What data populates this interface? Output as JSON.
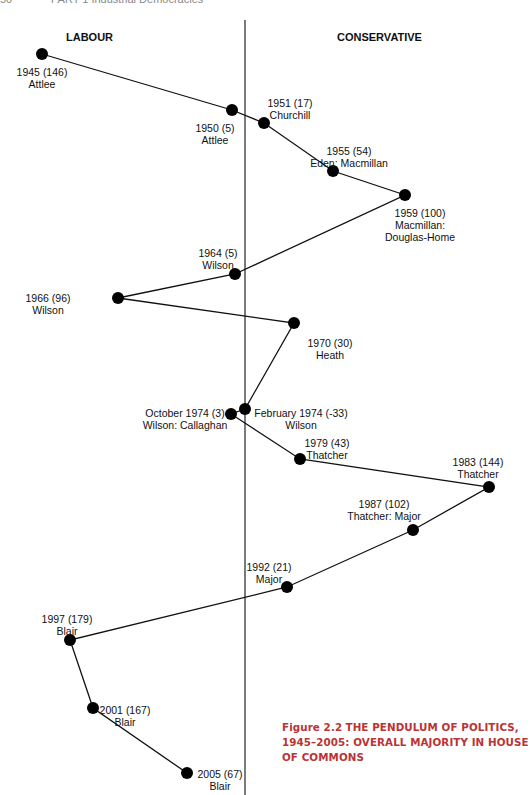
{
  "page_header": {
    "page_number": "50",
    "running_title": "PART 1 Industrial Democracies"
  },
  "sides": {
    "left": "LABOUR",
    "right": "CONSERVATIVE"
  },
  "caption": {
    "figure_label": "Figure 2.2",
    "title": "THE PENDULUM OF POLITICS, 1945–2005: OVERALL MAJORITY IN HOUSE OF COMMONS"
  },
  "chart_data": {
    "type": "line",
    "title": "The Pendulum of Politics, 1945–2005: Overall Majority in House of Commons",
    "xlabel": "",
    "ylabel": "",
    "orientation": "vertical timeline; horizontal displacement = majority, left = Labour, right = Conservative",
    "points": [
      {
        "year": "1945",
        "majority": 146,
        "party": "Labour",
        "pm": "Attlee",
        "x": 42,
        "y": 54
      },
      {
        "year": "1950",
        "majority": 5,
        "party": "Labour",
        "pm": "Attlee",
        "x": 232,
        "y": 110
      },
      {
        "year": "1951",
        "majority": 17,
        "party": "Conservative",
        "pm": "Churchill",
        "x": 264,
        "y": 123
      },
      {
        "year": "1955",
        "majority": 54,
        "party": "Conservative",
        "pm": "Eden: Macmillan",
        "x": 333,
        "y": 171
      },
      {
        "year": "1959",
        "majority": 100,
        "party": "Conservative",
        "pm": "Macmillan: Douglas-Home",
        "x": 405,
        "y": 195
      },
      {
        "year": "1964",
        "majority": 5,
        "party": "Labour",
        "pm": "Wilson",
        "x": 235,
        "y": 274
      },
      {
        "year": "1966",
        "majority": 96,
        "party": "Labour",
        "pm": "Wilson",
        "x": 118,
        "y": 298
      },
      {
        "year": "1970",
        "majority": 30,
        "party": "Conservative",
        "pm": "Heath",
        "x": 294,
        "y": 323
      },
      {
        "year": "February 1974",
        "majority": -33,
        "party": "Labour",
        "pm": "Wilson",
        "x": 245,
        "y": 409
      },
      {
        "year": "October 1974",
        "majority": 3,
        "party": "Labour",
        "pm": "Wilson: Callaghan",
        "x": 231,
        "y": 414
      },
      {
        "year": "1979",
        "majority": 43,
        "party": "Conservative",
        "pm": "Thatcher",
        "x": 300,
        "y": 459
      },
      {
        "year": "1983",
        "majority": 144,
        "party": "Conservative",
        "pm": "Thatcher",
        "x": 489,
        "y": 487
      },
      {
        "year": "1987",
        "majority": 102,
        "party": "Conservative",
        "pm": "Thatcher: Major",
        "x": 413,
        "y": 530
      },
      {
        "year": "1992",
        "majority": 21,
        "party": "Conservative",
        "pm": "Major",
        "x": 287,
        "y": 587
      },
      {
        "year": "1997",
        "majority": 179,
        "party": "Labour",
        "pm": "Blair",
        "x": 70,
        "y": 640
      },
      {
        "year": "2001",
        "majority": 167,
        "party": "Labour",
        "pm": "Blair",
        "x": 93,
        "y": 708
      },
      {
        "year": "2005",
        "majority": 67,
        "party": "Labour",
        "pm": "Blair",
        "x": 187,
        "y": 773
      }
    ],
    "labels": [
      {
        "l1": "1945  (146)",
        "l2": "Attlee",
        "lx": 42,
        "ly": 66
      },
      {
        "l1": "1950  (5)",
        "l2": "Attlee",
        "lx": 215,
        "ly": 122
      },
      {
        "l1": "1951  (17)",
        "l2": "Churchill",
        "lx": 290,
        "ly": 97
      },
      {
        "l1": "1955  (54)",
        "l2": "Eden: Macmillan",
        "lx": 349,
        "ly": 145
      },
      {
        "l1": "1959  (100)",
        "l2": "Macmillan:",
        "l3": "Douglas-Home",
        "lx": 420,
        "ly": 207
      },
      {
        "l1": "1964 (5)",
        "l2": "Wilson",
        "lx": 218,
        "ly": 247
      },
      {
        "l1": "1966 (96)",
        "l2": "Wilson",
        "lx": 18,
        "ly": 292
      },
      {
        "l1": "1970  (30)",
        "l2": "Heath",
        "lx": 330,
        "ly": 337
      },
      {
        "l1": "February 1974  (-33)",
        "l2": "Wilson",
        "lx": 301,
        "ly": 407
      },
      {
        "l1": "October 1974  (3)",
        "l2": "Wilson: Callaghan",
        "lx": 185,
        "ly": 407
      },
      {
        "l1": "1979  (43)",
        "l2": "Thatcher",
        "lx": 327,
        "ly": 437
      },
      {
        "l1": "1983  (144)",
        "l2": "Thatcher",
        "lx": 478,
        "ly": 456
      },
      {
        "l1": "1987  (102)",
        "l2": "Thatcher: Major",
        "lx": 384,
        "ly": 498
      },
      {
        "l1": "1992  (21)",
        "l2": "Major",
        "lx": 269,
        "ly": 561
      },
      {
        "l1": "1997 (179)",
        "l2": "Blair",
        "lx": 67,
        "ly": 613
      },
      {
        "l1": "2001 (167)",
        "l2": "Blair",
        "lx": 125,
        "ly": 704
      },
      {
        "l1": "2005 (67)",
        "l2": "Blair",
        "lx": 220,
        "ly": 768
      }
    ],
    "center_line_x": 245,
    "colors": {
      "line": "#111111",
      "marker": "#000000",
      "caption_accent": "#b33333"
    }
  }
}
